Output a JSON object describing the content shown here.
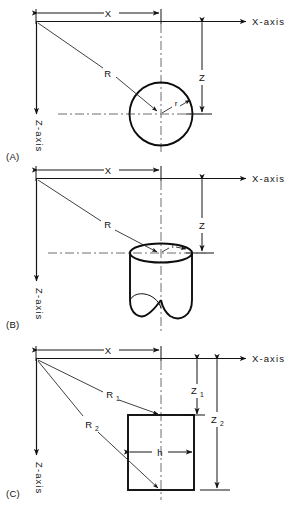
{
  "figure": {
    "title": "",
    "background_color": "#ffffff",
    "line_color": "#141414",
    "centerline_color": "#6e6e6e",
    "width": 303,
    "height": 509
  },
  "panels": [
    {
      "id": "A",
      "panel_label": "(A)",
      "shape": "circle",
      "x_axis_label": "X-axis",
      "z_axis_label": "Z-axis",
      "dimensions": [
        {
          "name": "x-dimension",
          "label": "X",
          "orientation": "horizontal"
        },
        {
          "name": "z-dimension",
          "label": "Z",
          "orientation": "vertical"
        }
      ],
      "radii": [
        {
          "name": "R-leader",
          "label": "R"
        },
        {
          "name": "r-leader",
          "label": "r"
        }
      ]
    },
    {
      "id": "B",
      "panel_label": "(B)",
      "shape": "cylinder",
      "x_axis_label": "X-axis",
      "z_axis_label": "Z-axis",
      "dimensions": [
        {
          "name": "x-dimension",
          "label": "X",
          "orientation": "horizontal"
        },
        {
          "name": "z-dimension",
          "label": "Z",
          "orientation": "vertical"
        }
      ],
      "radii": [
        {
          "name": "R-leader",
          "label": "R"
        },
        {
          "name": "r-leader",
          "label": "r"
        }
      ]
    },
    {
      "id": "C",
      "panel_label": "(C)",
      "shape": "rectangle",
      "x_axis_label": "X-axis",
      "z_axis_label": "Z-axis",
      "dimensions": [
        {
          "name": "x-dimension",
          "label": "X",
          "orientation": "horizontal"
        },
        {
          "name": "z1-dimension",
          "label": "Z",
          "sub": "1",
          "orientation": "vertical"
        },
        {
          "name": "z2-dimension",
          "label": "Z",
          "sub": "2",
          "orientation": "vertical"
        },
        {
          "name": "h-dimension",
          "label": "h",
          "orientation": "horizontal"
        }
      ],
      "radii": [
        {
          "name": "R1-leader",
          "label": "R",
          "sub": "1"
        },
        {
          "name": "R2-leader",
          "label": "R",
          "sub": "2"
        }
      ]
    }
  ]
}
